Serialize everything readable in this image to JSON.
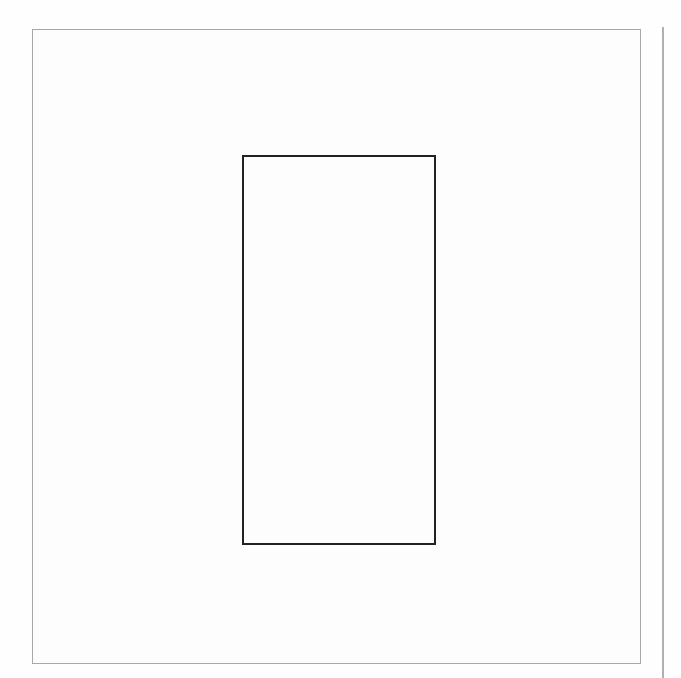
{
  "diagram": {
    "outer_frame": {
      "x": 32,
      "y": 29,
      "width": 609,
      "height": 635,
      "stroke": "#a8a8a8"
    },
    "inner_rectangle": {
      "x": 242,
      "y": 155,
      "width": 194,
      "height": 390,
      "stroke": "#222222"
    },
    "margin_line": {
      "x": 662,
      "y_start": 27,
      "y_end": 678,
      "stroke": "#b0b0b0"
    },
    "background": "#fefefe"
  }
}
